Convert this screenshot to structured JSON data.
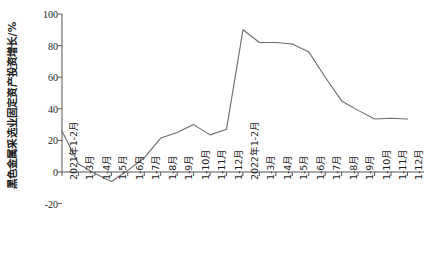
{
  "chart_data": {
    "type": "line",
    "title": "",
    "subtitle": "",
    "xlabel": "",
    "ylabel": "黑色金属采选业固定资产投资增长/%",
    "ylim": [
      -20,
      100
    ],
    "yticks": [
      100,
      80,
      60,
      40,
      20,
      0,
      -20
    ],
    "ytick_labels": [
      "100",
      "80",
      "60",
      "40",
      "20",
      "0",
      "-20"
    ],
    "grid": false,
    "legend": "none",
    "line_color": "#6b6b6b",
    "axis_color": "#555555",
    "categories": [
      "2021年1-2月",
      "1-3月",
      "1-4月",
      "1-5月",
      "1-6月",
      "1-7月",
      "1-8月",
      "1-9月",
      "1-10月",
      "1-11月",
      "1-12月",
      "2022年1-2月",
      "1-3月",
      "1-4月",
      "1-5月",
      "1-6月",
      "1-7月",
      "1-8月",
      "1-9月",
      "1-10月",
      "1-11月",
      "1-12月"
    ],
    "values": [
      26,
      5,
      -1,
      -6,
      1,
      9,
      21.5,
      25,
      30,
      23.5,
      27,
      90,
      82,
      82,
      81,
      76,
      60,
      45,
      39,
      33.5,
      34,
      33.5
    ],
    "series": [
      {
        "name": "黑色金属采选业固定资产投资增长",
        "values": [
          26,
          5,
          -1,
          -6,
          1,
          9,
          21.5,
          25,
          30,
          23.5,
          27,
          90,
          82,
          82,
          81,
          76,
          60,
          45,
          39,
          33.5,
          34,
          33.5
        ]
      }
    ]
  }
}
